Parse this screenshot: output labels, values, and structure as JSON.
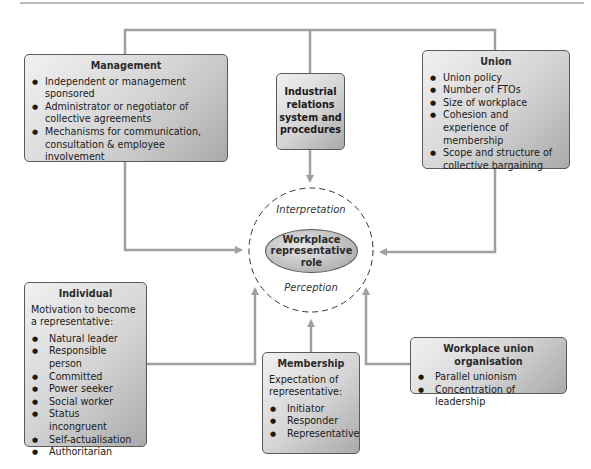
{
  "diagram": {
    "center": {
      "core": "Workplace representative role",
      "core_lines": [
        "Workplace",
        "representative",
        "role"
      ],
      "top_label": "Interpretation",
      "bottom_label": "Perception"
    },
    "management": {
      "title": "Management",
      "items": [
        "Independent or management sponsored",
        "Administrator or negotiator of collective agreements",
        "Mechanisms for communication, consultation & employee involvement"
      ]
    },
    "industrial_relations": {
      "title": "Industrial relations system and procedures"
    },
    "union": {
      "title": "Union",
      "items": [
        "Union policy",
        "Number of FTOs",
        "Size of workplace",
        "Cohesion and experience of membership",
        "Scope and structure of collective bargaining"
      ]
    },
    "individual": {
      "title": "Individual",
      "intro": "Motivation to become a representative:",
      "items": [
        "Natural leader",
        "Responsible person",
        "Committed",
        "Power seeker",
        "Social worker",
        "Status incongruent",
        "Self-actualisation",
        "Authoritarian"
      ]
    },
    "membership": {
      "title": "Membership",
      "intro": "Expectation of representative:",
      "items": [
        "Initiator",
        "Responder",
        "Representative"
      ]
    },
    "workplace_union_org": {
      "title": "Workplace union organisation",
      "items": [
        "Parallel unionism",
        "Concentration of leadership"
      ]
    },
    "colors": {
      "connector": "#a0a0a0",
      "box_border": "#5a5a5a",
      "page_rule": "#777777"
    }
  }
}
